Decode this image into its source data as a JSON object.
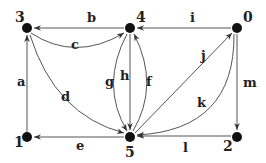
{
  "diagram": {
    "type": "directed-graph",
    "nodes": [
      {
        "id": "3",
        "label": "3",
        "x": 27,
        "y": 28
      },
      {
        "id": "4",
        "label": "4",
        "x": 130,
        "y": 28
      },
      {
        "id": "0",
        "label": "0",
        "x": 237,
        "y": 28
      },
      {
        "id": "1",
        "label": "1",
        "x": 27,
        "y": 137
      },
      {
        "id": "5",
        "label": "5",
        "x": 130,
        "y": 137
      },
      {
        "id": "2",
        "label": "2",
        "x": 237,
        "y": 137
      }
    ],
    "edges": [
      {
        "label": "a",
        "from": "1",
        "to": "3"
      },
      {
        "label": "b",
        "from": "4",
        "to": "3"
      },
      {
        "label": "c",
        "from": "3",
        "to": "4"
      },
      {
        "label": "d",
        "from": "3",
        "to": "5"
      },
      {
        "label": "e",
        "from": "5",
        "to": "1"
      },
      {
        "label": "f",
        "from": "5",
        "to": "4"
      },
      {
        "label": "g",
        "from": "4",
        "to": "5"
      },
      {
        "label": "h",
        "from": "4",
        "to": "5"
      },
      {
        "label": "i",
        "from": "0",
        "to": "4"
      },
      {
        "label": "j",
        "from": "5",
        "to": "0"
      },
      {
        "label": "k",
        "from": "0",
        "to": "5"
      },
      {
        "label": "l",
        "from": "2",
        "to": "5"
      },
      {
        "label": "m",
        "from": "0",
        "to": "2"
      }
    ]
  },
  "colors": {
    "node": "#111111",
    "edge": "#555555",
    "text": "#222222"
  }
}
